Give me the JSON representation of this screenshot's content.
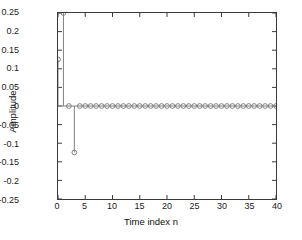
{
  "chart_data": {
    "type": "scatter",
    "plot_style": "stem",
    "title": "",
    "xlabel": "Time index n",
    "ylabel": "Amplitude",
    "xlim": [
      0,
      40
    ],
    "ylim": [
      -0.25,
      0.25
    ],
    "xticks": [
      0,
      5,
      10,
      15,
      20,
      25,
      30,
      35,
      40
    ],
    "xticklabels": [
      "0",
      "5",
      "10",
      "15",
      "20",
      "25",
      "30",
      "35",
      "40"
    ],
    "yticks": [
      0.25,
      0.2,
      0.15,
      0.1,
      0.05,
      0,
      -0.05,
      -0.1,
      -0.15,
      -0.2,
      -0.25
    ],
    "yticklabels": [
      "0.25",
      "0.2",
      "0.15",
      "0.1",
      "0.05",
      "0",
      "-0.05",
      "-0.1",
      "-0.15",
      "-0.2",
      "-0.25"
    ],
    "grid": false,
    "legend": null,
    "marker": "circle-open",
    "line_color": "#7f7f7f",
    "marker_color": "#7f7f7f",
    "axis_color": "#3a3a3a",
    "background": "#ffffff",
    "x": [
      0,
      1,
      2,
      3,
      4,
      5,
      6,
      7,
      8,
      9,
      10,
      11,
      12,
      13,
      14,
      15,
      16,
      17,
      18,
      19,
      20,
      21,
      22,
      23,
      24,
      25,
      26,
      27,
      28,
      29,
      30,
      31,
      32,
      33,
      34,
      35,
      36,
      37,
      38,
      39,
      40
    ],
    "values": [
      0.125,
      0.25,
      0,
      -0.125,
      0,
      0,
      0,
      0,
      0,
      0,
      0,
      0,
      0,
      0,
      0,
      0,
      0,
      0,
      0,
      0,
      0,
      0,
      0,
      0,
      0,
      0,
      0,
      0,
      0,
      0,
      0,
      0,
      0,
      0,
      0,
      0,
      0,
      0,
      0,
      0,
      0
    ]
  }
}
